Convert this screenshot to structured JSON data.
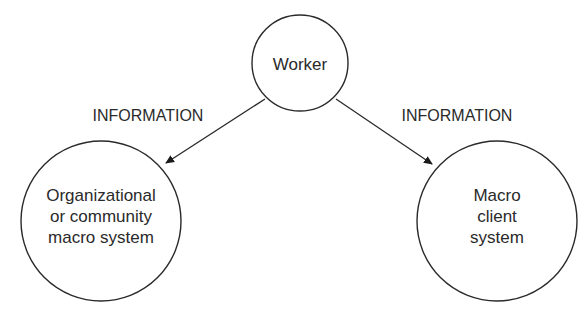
{
  "diagram": {
    "nodes": [
      {
        "id": "worker",
        "label_lines": [
          "Worker"
        ]
      },
      {
        "id": "org",
        "label_lines": [
          "Organizational",
          "or community",
          "macro system"
        ]
      },
      {
        "id": "client",
        "label_lines": [
          "Macro",
          "client",
          "system"
        ]
      }
    ],
    "edges": [
      {
        "from": "worker",
        "to": "org",
        "label": "INFORMATION"
      },
      {
        "from": "worker",
        "to": "client",
        "label": "INFORMATION"
      }
    ],
    "colors": {
      "stroke": "#2a2a2a",
      "background": "#ffffff",
      "text": "#2a2a2a"
    }
  }
}
